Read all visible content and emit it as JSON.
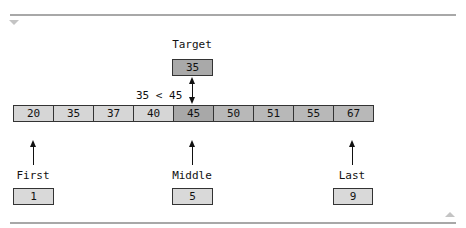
{
  "diagram": {
    "target": {
      "label": "Target",
      "value": "35"
    },
    "comparison": "35 < 45",
    "array": [
      {
        "value": "20",
        "shade": "light"
      },
      {
        "value": "35",
        "shade": "light"
      },
      {
        "value": "37",
        "shade": "light"
      },
      {
        "value": "40",
        "shade": "light"
      },
      {
        "value": "45",
        "shade": "dark"
      },
      {
        "value": "50",
        "shade": "mid"
      },
      {
        "value": "51",
        "shade": "mid"
      },
      {
        "value": "55",
        "shade": "mid"
      },
      {
        "value": "67",
        "shade": "mid"
      }
    ],
    "pointers": [
      {
        "label": "First",
        "value": "1"
      },
      {
        "label": "Middle",
        "value": "5"
      },
      {
        "label": "Last",
        "value": "9"
      }
    ],
    "controls": {
      "collapse_icon": "triangle-down",
      "expand_icon": "triangle-up"
    },
    "colors": {
      "light_cell": "#d6d6d6",
      "dark_cell": "#a8a8a8",
      "mid_cell": "#b8b8b8",
      "rule": "#a8a8a8"
    }
  }
}
